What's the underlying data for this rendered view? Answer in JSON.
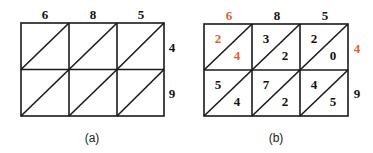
{
  "colors": {
    "line": "#1a1a1a",
    "highlight": "#e0603a",
    "text": "#111111"
  },
  "panel_a": {
    "caption": "(a)",
    "top_digits": [
      "6",
      "8",
      "5"
    ],
    "right_digits": [
      "4",
      "9"
    ]
  },
  "panel_b": {
    "caption": "(b)",
    "top_digits": [
      "6",
      "8",
      "5"
    ],
    "right_digits": [
      "4",
      "9"
    ],
    "highlighted": {
      "top_index": 0,
      "right_index": 0
    },
    "cells": [
      [
        {
          "tens": "2",
          "ones": "4"
        },
        {
          "tens": "3",
          "ones": "2"
        },
        {
          "tens": "2",
          "ones": "0"
        }
      ],
      [
        {
          "tens": "5",
          "ones": "4"
        },
        {
          "tens": "7",
          "ones": "2"
        },
        {
          "tens": "4",
          "ones": "5"
        }
      ]
    ]
  }
}
